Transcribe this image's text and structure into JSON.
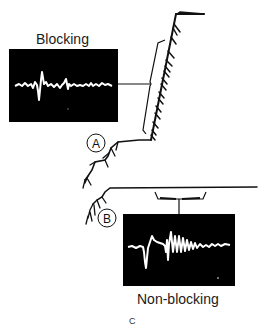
{
  "figure": {
    "panel_letter": "C",
    "scope_top": {
      "label": "Blocking",
      "background": "#000000",
      "trace_color": "#ffffff"
    },
    "scope_bottom": {
      "label": "Non-blocking",
      "background": "#000000",
      "trace_color": "#ffffff"
    },
    "recording_sites": [
      {
        "id": "A",
        "label": "A"
      },
      {
        "id": "B",
        "label": "B"
      }
    ],
    "colors": {
      "ink": "#111111",
      "paper": "#ffffff"
    }
  }
}
